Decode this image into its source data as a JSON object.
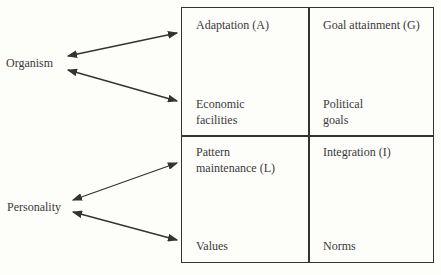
{
  "side_labels": {
    "organism": "Organism",
    "personality": "Personality"
  },
  "cells": {
    "adaptation": {
      "title": "Adaptation (A)",
      "bottom": "Economic\nfacilities"
    },
    "goal_attainment": {
      "title": "Goal attainment (G)",
      "bottom": "Political\ngoals"
    },
    "pattern_maintenance": {
      "title": "Pattern\nmaintenance (L)",
      "bottom": "Values"
    },
    "integration": {
      "title": "Integration (I)",
      "bottom": "Norms"
    }
  }
}
